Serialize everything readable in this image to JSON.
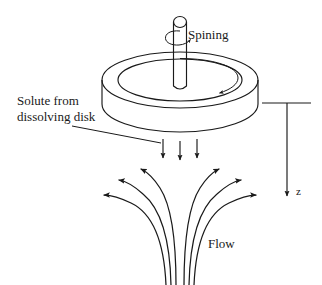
{
  "figure": {
    "background_color": "#ffffff",
    "ink_color": "#1a1a1a",
    "width": 322,
    "height": 285
  },
  "labels": {
    "spinning": "Spining",
    "solute_line1": "Solute from",
    "solute_line2": "dissolving disk",
    "flow": "Flow",
    "axis_z": "z"
  },
  "annotations": {
    "spin_arrow": "curved-rotation-arrow-around-shaft",
    "disk_rotation_arrow": "clockwise-arrow-on-disk-top",
    "solute_leader": "leader-line-from-label-to-disk-underside",
    "solute_arrows_count": 3,
    "streamlines_left_count": 3,
    "streamlines_right_count": 3,
    "axis_direction": "downward"
  },
  "geometry": {
    "disk_center_x": 180,
    "disk_top_ellipse_cy": 80,
    "disk_rx": 78,
    "disk_ry": 28,
    "disk_thickness": 26,
    "shaft_x": 180,
    "shaft_top_y": 16,
    "axis_x": 287,
    "axis_top_y": 103,
    "axis_bottom_y": 200
  }
}
